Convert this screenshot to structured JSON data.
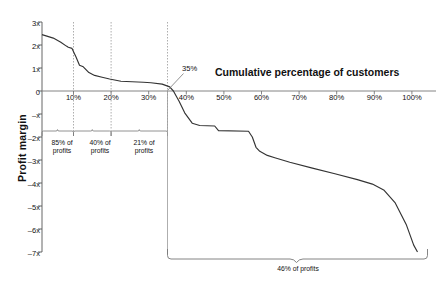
{
  "chart_data": {
    "type": "line",
    "title": "Cumulative percentage of customers",
    "xlabel": "Cumulative percentage of customers",
    "ylabel": "Profit margin",
    "xlim": [
      0,
      100
    ],
    "ylim": [
      -7,
      3
    ],
    "grid": "vertical dotted gridlines at 10%, 20% and 35%",
    "legend": "none",
    "x_ticks": [
      "10%",
      "20%",
      "30%",
      "40%",
      "50%",
      "60%",
      "70%",
      "80%",
      "90%",
      "100%"
    ],
    "x_tick_values": [
      10,
      20,
      30,
      40,
      50,
      60,
      70,
      80,
      90,
      100
    ],
    "y_ticks": [
      "3x",
      "2x",
      "1x",
      "0",
      "–x",
      "–2x",
      "–3x",
      "–4x",
      "–5x",
      "–6x",
      "–7x"
    ],
    "y_tick_values": [
      3,
      2,
      1,
      0,
      -1,
      -2,
      -3,
      -4,
      -5,
      -6,
      -7
    ],
    "series": [
      {
        "name": "Cumulative profit margin by customer",
        "x": [
          0,
          3,
          5,
          6.5,
          7,
          8,
          9,
          10,
          11,
          12.5,
          14,
          16,
          18,
          21,
          24,
          27,
          29,
          32,
          34,
          35,
          36.5,
          38,
          40,
          42,
          46,
          47,
          55,
          56,
          57,
          58,
          60,
          62,
          66,
          72,
          78,
          84,
          88,
          91,
          94,
          97,
          99,
          100
        ],
        "y": [
          2.45,
          2.3,
          2.12,
          1.95,
          1.9,
          1.85,
          1.5,
          1.12,
          1.05,
          0.8,
          0.68,
          0.6,
          0.52,
          0.42,
          0.4,
          0.38,
          0.36,
          0.3,
          0.18,
          0.0,
          -0.45,
          -0.95,
          -1.4,
          -1.5,
          -1.52,
          -1.72,
          -1.75,
          -2.0,
          -2.45,
          -2.62,
          -2.8,
          -2.9,
          -3.1,
          -3.35,
          -3.6,
          -3.85,
          -4.05,
          -4.3,
          -4.85,
          -5.8,
          -6.7,
          -7.0
        ]
      }
    ],
    "annotations": [
      {
        "name": "zero-crossing-callout",
        "text": "35%",
        "x": 35,
        "y": 0
      },
      {
        "name": "brace-label-1",
        "text": "85% of\nprofits",
        "line1": "85% of",
        "line2": "profits",
        "x_range": [
          0,
          10
        ]
      },
      {
        "name": "brace-label-2",
        "text": "40% of\nprofits",
        "line1": "40% of",
        "line2": "profits",
        "x_range": [
          10,
          20
        ]
      },
      {
        "name": "brace-label-3",
        "text": "21% of\nprofits",
        "line1": "21% of",
        "line2": "profits",
        "x_range": [
          20,
          35
        ]
      },
      {
        "name": "brace-label-4",
        "text": "46% of profits",
        "line1": "46% of profits",
        "x_range": [
          35,
          100
        ]
      }
    ]
  },
  "axis": {
    "y_title": "Profit margin",
    "x_title": "Cumulative percentage of customers",
    "y_labels": {
      "t0": "3x",
      "t1": "2x",
      "t2": "1x",
      "t3": "0",
      "t4": "–x",
      "t5": "–2x",
      "t6": "–3x",
      "t7": "–4x",
      "t8": "–5x",
      "t9": "–6x",
      "t10": "–7x"
    },
    "x_labels": {
      "t10": "10%",
      "t20": "20%",
      "t30": "30%",
      "t40": "40%",
      "t50": "50%",
      "t60": "60%",
      "t70": "70%",
      "t80": "80%",
      "t90": "90%",
      "t100": "100%"
    }
  },
  "callouts": {
    "crossing": "35%",
    "brace1_line1": "85% of",
    "brace1_line2": "profits",
    "brace2_line1": "40% of",
    "brace2_line2": "profits",
    "brace3_line1": "21% of",
    "brace3_line2": "profits",
    "brace4": "46% of profits"
  },
  "colors": {
    "line": "#333333",
    "axis": "#555555",
    "grid": "#aaaaaa",
    "text": "#111111",
    "background": "#ffffff"
  }
}
